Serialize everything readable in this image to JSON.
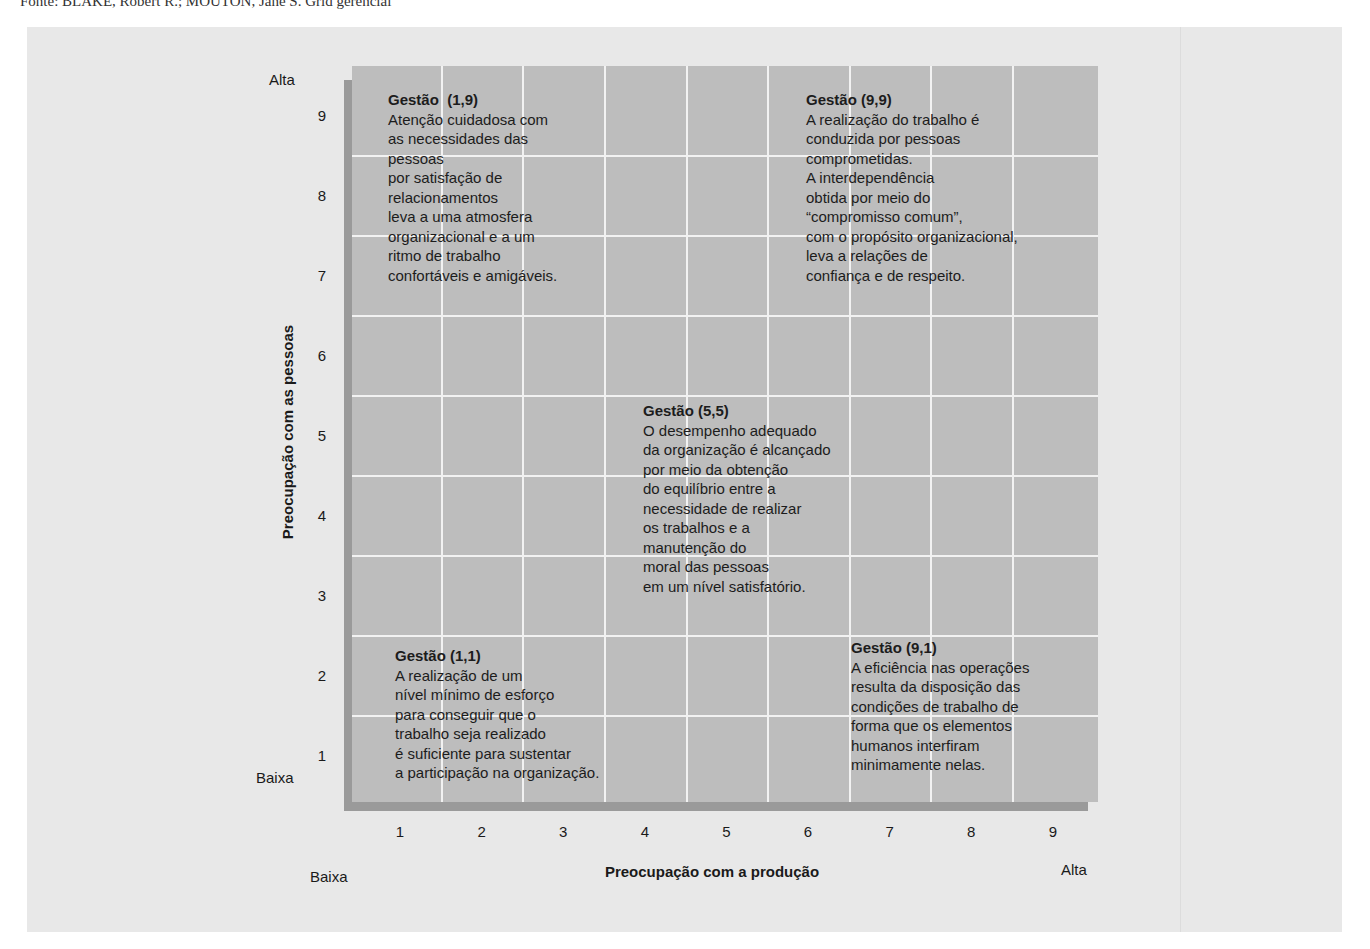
{
  "caption": "Fonte: BLAKE, Robert R.; MOUTON, Jane S. Grid gerencial",
  "chart_data": {
    "type": "grid-diagram",
    "title": "Grid gerencial",
    "xlabel": "Preocupação com a produção",
    "ylabel": "Preocupação com as pessoas",
    "x_ticks": [
      "1",
      "2",
      "3",
      "4",
      "5",
      "6",
      "7",
      "8",
      "9"
    ],
    "y_ticks": [
      "9",
      "8",
      "7",
      "6",
      "5",
      "4",
      "3",
      "2",
      "1"
    ],
    "xlim": [
      1,
      9
    ],
    "ylim": [
      1,
      9
    ],
    "x_low_label": "Baixa",
    "x_high_label": "Alta",
    "y_low_label": "Baixa",
    "y_high_label": "Alta",
    "grid": true,
    "styles": [
      {
        "id": "1,9",
        "x": 1,
        "y": 9,
        "title": "Gestão  (1,9)",
        "lines": [
          "Atenção cuidadosa com",
          "as necessidades das",
          "pessoas",
          "por satisfação de",
          "relacionamentos",
          "leva a uma atmosfera",
          "organizacional e a um",
          "ritmo de trabalho",
          "confortáveis e amigáveis."
        ]
      },
      {
        "id": "9,9",
        "x": 9,
        "y": 9,
        "title": "Gestão (9,9)",
        "lines": [
          "A realização do trabalho é",
          "conduzida por pessoas",
          "comprometidas.",
          "A interdependência",
          "obtida por meio do",
          "“compromisso comum”,",
          "com o propósito organizacional,",
          "leva a relações de",
          "confiança e de respeito."
        ]
      },
      {
        "id": "5,5",
        "x": 5,
        "y": 5,
        "title": "Gestão (5,5)",
        "lines": [
          "O desempenho adequado",
          "da organização é alcançado",
          "por meio da obtenção",
          "do equilíbrio entre a",
          "necessidade de realizar",
          "os trabalhos e a",
          "manutenção do",
          "moral das pessoas",
          "em um nível satisfatório."
        ]
      },
      {
        "id": "1,1",
        "x": 1,
        "y": 1,
        "title": "Gestão (1,1)",
        "lines": [
          "A realização de um",
          "nível mínimo de esforço",
          "para conseguir que o",
          "trabalho seja realizado",
          "é suficiente para sustentar",
          "a participação na organização."
        ]
      },
      {
        "id": "9,1",
        "x": 9,
        "y": 1,
        "title": "Gestão (9,1)",
        "lines": [
          "A eficiência nas operações",
          "resulta da disposição das",
          "condições de trabalho de",
          "forma que os elementos",
          "humanos interfiram",
          "minimamente nelas."
        ]
      }
    ]
  },
  "colors": {
    "grid_fill": "#bdbdbd",
    "grid_lines": "#f2f2f2",
    "shadow": "#9a9a9a",
    "page_bg": "#e8e8e8"
  }
}
